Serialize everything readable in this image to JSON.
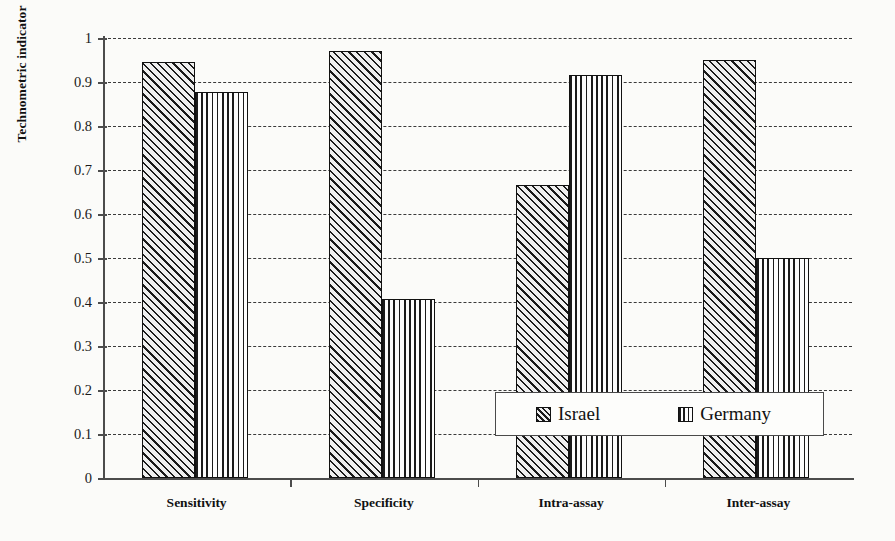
{
  "chart_data": {
    "type": "bar",
    "title": "",
    "xlabel": "",
    "ylabel": "Technometric indicator",
    "categories": [
      "Sensitivity",
      "Specificity",
      "Intra-assay",
      "Inter-assay"
    ],
    "series": [
      {
        "name": "Israel",
        "values": [
          0.945,
          0.97,
          0.665,
          0.95
        ]
      },
      {
        "name": "Germany",
        "values": [
          0.878,
          0.407,
          0.915,
          0.5
        ]
      }
    ],
    "ylim": [
      0,
      1
    ],
    "ytick_values": [
      0,
      0.1,
      0.2,
      0.3,
      0.4,
      0.5,
      0.6,
      0.7,
      0.8,
      0.9,
      1
    ],
    "ytick_labels": [
      "0",
      "0.1",
      "0.2",
      "0.3",
      "0.4",
      "0.5",
      "0.6",
      "0.7",
      "0.8",
      "0.9",
      "1"
    ],
    "grid": "horizontal-dashed",
    "legend_position": "inside-lower-right",
    "colors": {
      "israel_fill": "#efefef",
      "germany_fill": "#fdfdfd",
      "outline": "#111111",
      "gridline": "#3a3a3a",
      "axis": "#4c4c4c",
      "background": "#fbfbf9"
    },
    "patterns": {
      "israel": "diagonal-hatch",
      "germany": "vertical-lines"
    }
  },
  "legend": {
    "entries": [
      {
        "label": "Israel",
        "pattern": "diagonal-hatch"
      },
      {
        "label": "Germany",
        "pattern": "vertical-lines"
      }
    ]
  }
}
